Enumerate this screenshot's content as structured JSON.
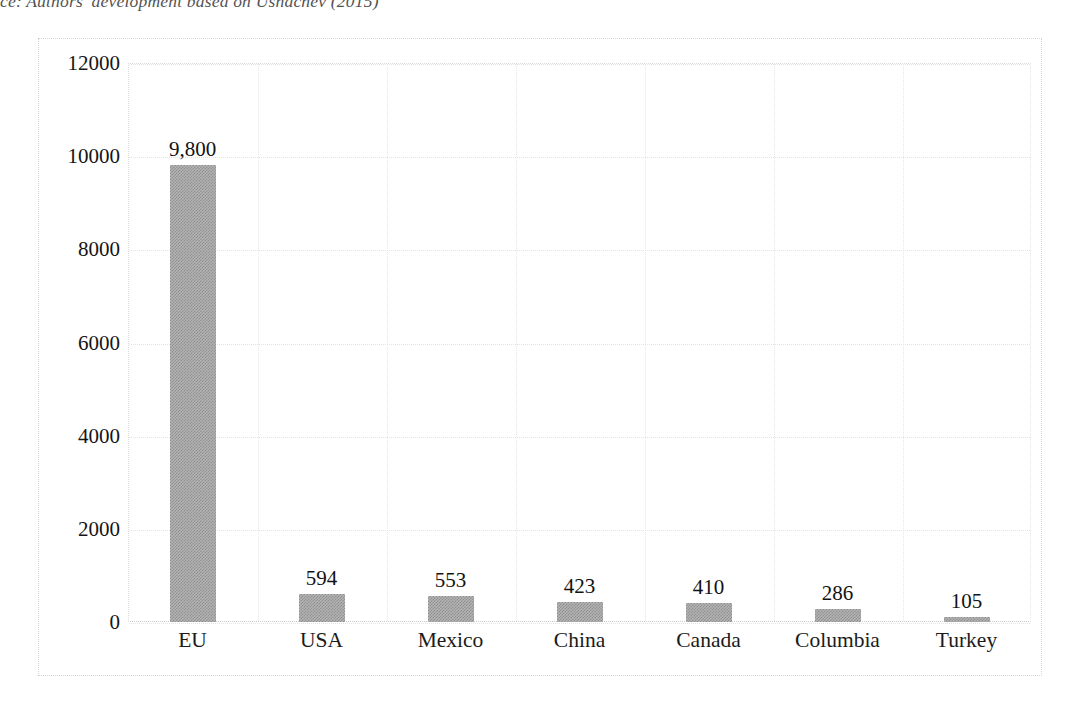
{
  "figure": {
    "source_note": "ce: Authors' development based on Ushachev (2015)"
  },
  "chart_data": {
    "type": "bar",
    "title": "",
    "subtitle": "",
    "xlabel": "",
    "ylabel": "",
    "categories": [
      "EU",
      "USA",
      "Mexico",
      "China",
      "Canada",
      "Columbia",
      "Turkey"
    ],
    "values": [
      9800,
      594,
      553,
      423,
      410,
      286,
      105
    ],
    "value_labels": [
      "9,800",
      "594",
      "553",
      "423",
      "410",
      "286",
      "105"
    ],
    "ylim": [
      0,
      12000
    ],
    "ytick_values": [
      0,
      2000,
      4000,
      6000,
      8000,
      10000,
      12000
    ],
    "ytick_labels": [
      "0",
      "2000",
      "4000",
      "6000",
      "8000",
      "10000",
      "12000"
    ],
    "grid": "dotted-light",
    "legend": "none",
    "bar_color": "#b4b4b4",
    "bar_pattern": "checkered-gray",
    "frame_color": "#d2d2d2",
    "text_color": "#151515"
  }
}
